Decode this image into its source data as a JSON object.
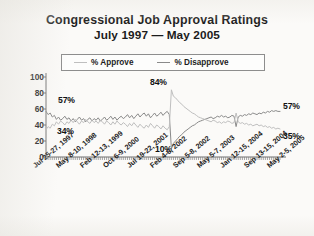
{
  "title": {
    "line1": "Congressional Job Approval Ratings",
    "line2": "July 1997 — May 2005"
  },
  "legend": {
    "approve_label": "% Approve",
    "disapprove_label": "% Disapprove",
    "approve_color": "#bfbfbf",
    "disapprove_color": "#8a8a8a"
  },
  "annotations": {
    "left_disapprove": "57%",
    "left_approve": "34%",
    "peak_approve": "84%",
    "trough_disapprove": "10%",
    "right_approve": "57%",
    "right_disapprove": "35%"
  },
  "chart_data": {
    "type": "line",
    "title": "Congressional Job Approval Ratings July 1997 — May 2005",
    "xlabel": "",
    "ylabel": "",
    "ylim": [
      0,
      100
    ],
    "yticks": [
      0,
      20,
      40,
      60,
      80,
      100
    ],
    "grid": false,
    "legend_position": "top",
    "xtick_labels": [
      "Jul 25-27, 1997",
      "May 8-10, 1998",
      "Feb 12-13, 1999",
      "Oct 6-9, 2000",
      "Jul 19-22, 2001",
      "Feb 4-6, 2002",
      "Sep 5-8, 2002",
      "May 5-7, 2003",
      "Jan 12-15, 2004",
      "Sep 13-15, 2004",
      "May 2-5, 2005"
    ],
    "annotated_points": [
      {
        "label": "57%",
        "series": "% Disapprove",
        "value": 57,
        "x": "Jul 25-27, 1997"
      },
      {
        "label": "34%",
        "series": "% Approve",
        "value": 34,
        "x": "Jul 25-27, 1997"
      },
      {
        "label": "84%",
        "series": "% Approve",
        "value": 84,
        "x": "Oct 2001"
      },
      {
        "label": "10%",
        "series": "% Disapprove",
        "value": 10,
        "x": "Oct 2001"
      },
      {
        "label": "57%",
        "series": "% Disapprove",
        "value": 57,
        "x": "May 2-5, 2005"
      },
      {
        "label": "35%",
        "series": "% Approve",
        "value": 35,
        "x": "May 2-5, 2005"
      }
    ],
    "series": [
      {
        "name": "% Approve",
        "color": "#bfbfbf",
        "values": [
          34,
          38,
          36,
          41,
          39,
          44,
          41,
          45,
          43,
          40,
          44,
          42,
          46,
          43,
          47,
          44,
          41,
          45,
          43,
          47,
          44,
          42,
          46,
          43,
          45,
          42,
          46,
          44,
          41,
          45,
          43,
          40,
          44,
          41,
          45,
          42,
          40,
          43,
          41,
          38,
          42,
          39,
          43,
          40,
          37,
          41,
          38,
          36,
          40,
          37,
          42,
          39,
          36,
          40,
          38,
          35,
          39,
          36,
          34,
          38,
          84,
          76,
          74,
          71,
          68,
          66,
          63,
          61,
          59,
          57,
          55,
          54,
          52,
          50,
          49,
          48,
          47,
          46,
          45,
          44,
          46,
          45,
          43,
          44,
          42,
          44,
          43,
          45,
          44,
          42,
          43,
          55,
          44,
          42,
          43,
          41,
          42,
          40,
          41,
          39,
          40,
          41,
          39,
          40,
          38,
          39,
          37,
          38,
          36,
          37,
          35,
          36,
          35
        ]
      },
      {
        "name": "% Disapprove",
        "color": "#8a8a8a",
        "values": [
          57,
          53,
          55,
          50,
          52,
          47,
          50,
          46,
          48,
          51,
          47,
          49,
          45,
          48,
          44,
          47,
          50,
          46,
          48,
          44,
          47,
          49,
          45,
          48,
          46,
          49,
          45,
          47,
          50,
          46,
          48,
          51,
          47,
          50,
          46,
          49,
          51,
          48,
          50,
          53,
          49,
          52,
          48,
          51,
          54,
          50,
          53,
          55,
          51,
          54,
          49,
          52,
          55,
          51,
          53,
          56,
          52,
          55,
          57,
          53,
          10,
          17,
          20,
          23,
          26,
          28,
          31,
          33,
          35,
          37,
          39,
          40,
          42,
          44,
          45,
          46,
          47,
          48,
          49,
          50,
          48,
          49,
          51,
          50,
          52,
          50,
          51,
          49,
          50,
          52,
          51,
          38,
          50,
          52,
          51,
          53,
          52,
          54,
          53,
          55,
          54,
          53,
          55,
          54,
          56,
          55,
          57,
          56,
          58,
          57,
          58,
          57,
          57
        ]
      }
    ]
  }
}
